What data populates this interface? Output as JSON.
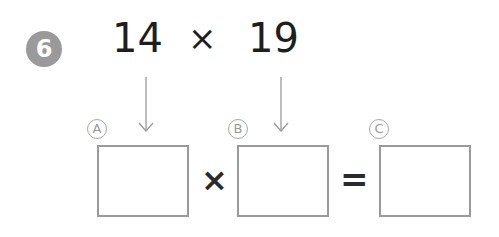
{
  "problem": {
    "number": "6",
    "operand1": "14",
    "operator": "×",
    "operand2": "19"
  },
  "equation": {
    "boxes": [
      {
        "label": "A",
        "value": ""
      },
      {
        "label": "B",
        "value": ""
      },
      {
        "label": "C",
        "value": ""
      }
    ],
    "times_sign": "×",
    "equals_sign": "="
  },
  "colors": {
    "badge": "#9a9a9a",
    "text": "#1e1e1e",
    "box_border": "#9a9a9a"
  }
}
